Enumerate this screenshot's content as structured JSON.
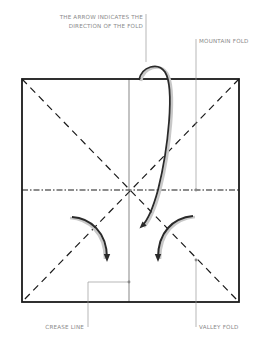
{
  "diagram": {
    "labels": {
      "arrow_line1": "THE ARROW INDICATES THE",
      "arrow_line2": "DIRECTION OF THE FOLD",
      "mountain_fold": "MOUNTAIN FOLD",
      "crease_line": "CREASE LINE",
      "valley_fold": "VALLEY FOLD"
    },
    "line_types": {
      "mountain_fold": "dash-dot",
      "valley_fold": "dashed",
      "crease_line": "thin solid"
    },
    "colors": {
      "outline": "#1a1a1a",
      "leader": "#9a9a9a",
      "label_text": "#8a8a8a",
      "arrow": "#2a2a2a",
      "arrow_shadow": "#c8c8c8"
    }
  }
}
